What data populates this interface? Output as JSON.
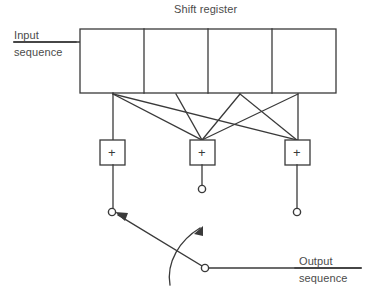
{
  "diagram": {
    "title": "Shift register",
    "input_label_line1": "Input",
    "input_label_line2": "sequence",
    "output_label_line1": "Output",
    "output_label_line2": "sequence",
    "stroke_color": "#3a3a3a",
    "text_color": "#4b4b4b",
    "background_color": "#ffffff",
    "shift_register": {
      "cell_count": 4,
      "x": 80,
      "y": 29,
      "width": 256,
      "height": 64,
      "cell_boundaries_x": [
        80,
        144,
        208,
        272,
        336
      ]
    },
    "taps": [
      {
        "name": "tap-1",
        "x": 113
      },
      {
        "name": "tap-2",
        "x": 176
      },
      {
        "name": "tap-3",
        "x": 240
      },
      {
        "name": "tap-4",
        "x": 298
      }
    ],
    "adders": [
      {
        "name": "adder-1",
        "symbol": "+",
        "x": 100,
        "y": 140,
        "width": 25,
        "height": 25
      },
      {
        "name": "adder-2",
        "symbol": "+",
        "x": 190,
        "y": 140,
        "width": 25,
        "height": 25
      },
      {
        "name": "adder-3",
        "symbol": "+",
        "x": 285,
        "y": 140,
        "width": 25,
        "height": 25
      }
    ],
    "terminals": [
      {
        "name": "adder-2-output-terminal",
        "cx": 202,
        "cy": 189,
        "r": 4
      },
      {
        "name": "adder-3-output-terminal",
        "cx": 297,
        "cy": 212,
        "r": 4
      },
      {
        "name": "commutator-pivot-terminal",
        "cx": 112,
        "cy": 212,
        "r": 4
      },
      {
        "name": "commutator-contact-terminal",
        "cx": 205,
        "cy": 268,
        "r": 4
      }
    ],
    "commutator": {
      "name": "rotary-commutator-switch",
      "arm_from_x": 205,
      "arm_from_y": 268,
      "arm_to_x": 112,
      "arm_to_y": 212,
      "rotation_arrow_label": ""
    },
    "connections": [
      {
        "from": "tap-1",
        "to": "adder-1"
      },
      {
        "from": "tap-1",
        "to": "adder-2"
      },
      {
        "from": "tap-1",
        "to": "adder-3"
      },
      {
        "from": "tap-2",
        "to": "adder-2"
      },
      {
        "from": "tap-3",
        "to": "adder-2"
      },
      {
        "from": "tap-3",
        "to": "adder-3"
      },
      {
        "from": "tap-4",
        "to": "adder-2"
      },
      {
        "from": "tap-4",
        "to": "adder-3"
      }
    ]
  }
}
